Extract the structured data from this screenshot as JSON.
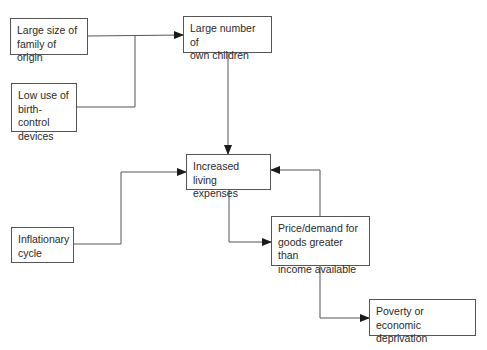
{
  "diagram": {
    "type": "flowchart",
    "nodes": [
      {
        "id": "family_size",
        "label": "Large size of\nfamily of origin"
      },
      {
        "id": "birth_control",
        "label": "Low use of\nbirth-control\ndevices"
      },
      {
        "id": "own_children",
        "label": "Large number of\nown children"
      },
      {
        "id": "living_expenses",
        "label": "Increased living\nexpenses"
      },
      {
        "id": "inflation",
        "label": "Inflationary\ncycle"
      },
      {
        "id": "price_demand",
        "label": "Price/demand for\ngoods greater than\nincome available"
      },
      {
        "id": "poverty",
        "label": "Poverty or economic\ndeprivation"
      }
    ],
    "edges": [
      {
        "from": "family_size",
        "to": "own_children"
      },
      {
        "from": "birth_control",
        "to": "own_children"
      },
      {
        "from": "own_children",
        "to": "living_expenses"
      },
      {
        "from": "inflation",
        "to": "living_expenses"
      },
      {
        "from": "living_expenses",
        "to": "price_demand"
      },
      {
        "from": "price_demand",
        "to": "living_expenses"
      },
      {
        "from": "price_demand",
        "to": "poverty"
      }
    ],
    "colors": {
      "line": "#555555",
      "text": "#2a2a2a",
      "background": "#ffffff"
    }
  }
}
